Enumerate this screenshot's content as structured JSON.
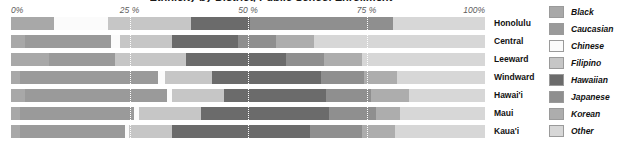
{
  "title": "Ethnicity by District, Public School Enrollment",
  "axis": {
    "ticks": [
      "0%",
      "25 %",
      "50 %",
      "75 %",
      "100%"
    ],
    "min": 0,
    "max": 100
  },
  "legend": {
    "items": [
      {
        "label": "Black",
        "color": "#a8a8a8"
      },
      {
        "label": "Caucasian",
        "color": "#9a9a9a"
      },
      {
        "label": "Chinese",
        "color": "#fbfbfb"
      },
      {
        "label": "Filipino",
        "color": "#c6c6c6"
      },
      {
        "label": "Hawaiian",
        "color": "#6b6b6b"
      },
      {
        "label": "Japanese",
        "color": "#8f8f8f"
      },
      {
        "label": "Korean",
        "color": "#adadad"
      },
      {
        "label": "Other",
        "color": "#d7d7d7"
      }
    ]
  },
  "chart_data": {
    "type": "bar",
    "orientation": "horizontal",
    "stacked": true,
    "normalized": true,
    "title": "Ethnicity by District, Public School Enrollment",
    "xlabel": "",
    "ylabel": "",
    "xlim": [
      0,
      100
    ],
    "grid": true,
    "legend_position": "right",
    "categories": [
      "Honolulu",
      "Central",
      "Leeward",
      "Windward",
      "Hawai'i",
      "Maui",
      "Kaua'i"
    ],
    "series": [
      {
        "name": "Black",
        "color": "#a8a8a8",
        "values": [
          9.0,
          3.0,
          8.0,
          2.0,
          3.0,
          2.0,
          2.0
        ]
      },
      {
        "name": "Caucasian",
        "color": "#9a9a9a",
        "values": [
          0.0,
          18.0,
          14.0,
          29.0,
          30.0,
          24.0,
          22.0
        ]
      },
      {
        "name": "Chinese",
        "color": "#fbfbfb",
        "values": [
          11.5,
          2.0,
          0.0,
          1.5,
          1.0,
          1.0,
          1.0
        ]
      },
      {
        "name": "Filipino",
        "color": "#c6c6c6",
        "values": [
          17.5,
          11.0,
          15.0,
          10.0,
          11.0,
          13.0,
          9.0
        ]
      },
      {
        "name": "Hawaiian",
        "color": "#6b6b6b",
        "values": [
          12.5,
          14.0,
          21.0,
          23.0,
          21.5,
          27.0,
          29.0
        ]
      },
      {
        "name": "Japanese",
        "color": "#8f8f8f",
        "values": [
          30.0,
          8.0,
          8.0,
          9.0,
          9.5,
          10.0,
          11.0
        ]
      },
      {
        "name": "Korean",
        "color": "#adadad",
        "values": [
          0.0,
          8.0,
          8.0,
          7.0,
          8.0,
          5.0,
          7.0
        ]
      },
      {
        "name": "Other",
        "color": "#d7d7d7",
        "values": [
          19.5,
          36.0,
          26.0,
          18.5,
          16.0,
          18.0,
          19.0
        ]
      }
    ]
  }
}
